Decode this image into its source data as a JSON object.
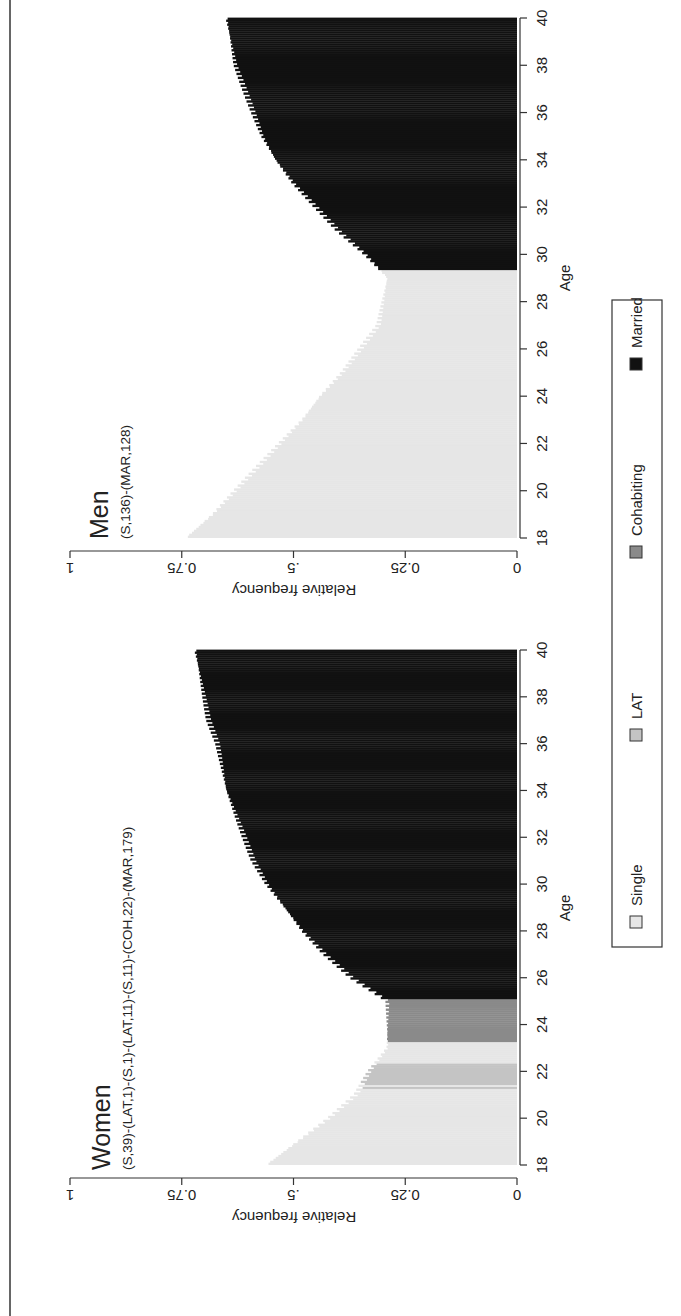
{
  "figure": {
    "orientation": "rotated-90-ccw",
    "panels": [
      {
        "id": "women",
        "title": "Women",
        "subtitle": "(S,39)-(LAT,1)-(S,1)-(LAT,11)-(S,11)-(COH,22)-(MAR,179)",
        "ylabel": "Relative frequency",
        "xlabel": "Age",
        "yticks": [
          "1",
          "0.75",
          ".5",
          "0.25",
          "0"
        ],
        "xticks": [
          "18",
          "20",
          "22",
          "24",
          "26",
          "28",
          "30",
          "32",
          "34",
          "36",
          "38",
          "40"
        ]
      },
      {
        "id": "men",
        "title": "Men",
        "subtitle": "(S,136)-(MAR,128)",
        "ylabel": "Relative frequency",
        "xlabel": "Age",
        "yticks": [
          "1",
          "0.75",
          ".5",
          "0.25",
          "0"
        ],
        "xticks": [
          "18",
          "20",
          "22",
          "24",
          "26",
          "28",
          "30",
          "32",
          "34",
          "36",
          "38",
          "40"
        ]
      }
    ],
    "legend": [
      {
        "label": "Single",
        "color": "#e6e6e6"
      },
      {
        "label": "LAT",
        "color": "#c4c4c4"
      },
      {
        "label": "Cohabiting",
        "color": "#8a8a8a"
      },
      {
        "label": "Married",
        "color": "#111111"
      }
    ]
  },
  "chart_data": [
    {
      "type": "area",
      "title": "Women",
      "subtitle": "(S,39)-(LAT,1)-(S,1)-(LAT,11)-(S,11)-(COH,22)-(MAR,179)",
      "xlabel": "Age",
      "ylabel": "Relative frequency",
      "xlim": [
        18,
        40
      ],
      "ylim": [
        0,
        1
      ],
      "xticks": [
        18,
        20,
        22,
        24,
        26,
        28,
        30,
        32,
        34,
        36,
        38,
        40
      ],
      "yticks": [
        0,
        0.25,
        0.5,
        0.75,
        1
      ],
      "ytick_labels": [
        "0",
        "0.25",
        ".5",
        "0.75",
        "1"
      ],
      "grid": false,
      "legend_position": "bottom",
      "state_sequence": [
        {
          "state": "Single",
          "from_age": 18.0,
          "to_age": 21.25
        },
        {
          "state": "LAT",
          "from_age": 21.25,
          "to_age": 21.33
        },
        {
          "state": "Single",
          "from_age": 21.33,
          "to_age": 21.42
        },
        {
          "state": "LAT",
          "from_age": 21.42,
          "to_age": 22.33
        },
        {
          "state": "Single",
          "from_age": 22.33,
          "to_age": 23.25
        },
        {
          "state": "Cohabiting",
          "from_age": 23.25,
          "to_age": 25.08
        },
        {
          "state": "Married",
          "from_age": 25.08,
          "to_age": 40.0
        }
      ],
      "x": [
        18,
        19,
        20,
        21,
        22,
        23,
        24,
        25,
        26,
        27,
        28,
        29,
        30,
        31,
        32,
        33,
        34,
        35,
        36,
        37,
        38,
        39,
        40
      ],
      "values": [
        0.56,
        0.49,
        0.42,
        0.36,
        0.33,
        0.29,
        0.29,
        0.29,
        0.37,
        0.43,
        0.48,
        0.52,
        0.56,
        0.59,
        0.61,
        0.63,
        0.65,
        0.66,
        0.67,
        0.69,
        0.7,
        0.71,
        0.72
      ]
    },
    {
      "type": "area",
      "title": "Men",
      "subtitle": "(S,136)-(MAR,128)",
      "xlabel": "Age",
      "ylabel": "Relative frequency",
      "xlim": [
        18,
        40
      ],
      "ylim": [
        0,
        1
      ],
      "xticks": [
        18,
        20,
        22,
        24,
        26,
        28,
        30,
        32,
        34,
        36,
        38,
        40
      ],
      "yticks": [
        0,
        0.25,
        0.5,
        0.75,
        1
      ],
      "ytick_labels": [
        "0",
        "0.25",
        ".5",
        "0.75",
        "1"
      ],
      "grid": false,
      "legend_position": "bottom",
      "state_sequence": [
        {
          "state": "Single",
          "from_age": 18.0,
          "to_age": 29.33
        },
        {
          "state": "Married",
          "from_age": 29.33,
          "to_age": 40.0
        }
      ],
      "x": [
        18,
        19,
        20,
        21,
        22,
        23,
        24,
        25,
        26,
        27,
        28,
        29,
        30,
        31,
        32,
        33,
        34,
        35,
        36,
        37,
        38,
        39,
        40
      ],
      "values": [
        0.74,
        0.68,
        0.63,
        0.58,
        0.53,
        0.48,
        0.44,
        0.39,
        0.35,
        0.31,
        0.3,
        0.29,
        0.34,
        0.4,
        0.45,
        0.5,
        0.54,
        0.57,
        0.59,
        0.61,
        0.63,
        0.64,
        0.65
      ]
    }
  ]
}
